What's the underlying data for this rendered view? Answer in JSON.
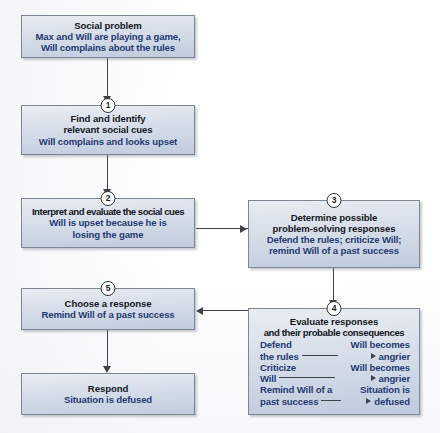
{
  "diagram": {
    "type": "flowchart",
    "nodes": [
      {
        "id": "social-problem",
        "badge": "",
        "title": "Social problem",
        "lines": [
          "Max and Will are playing a game,",
          "Will complains about the rules"
        ]
      },
      {
        "id": "find-identify",
        "badge": "1",
        "title_lines": [
          "Find and identify",
          "relevant social cues"
        ],
        "lines": [
          "Will complains and looks upset"
        ]
      },
      {
        "id": "interpret-evaluate",
        "badge": "2",
        "title_lines": [
          "Interpret and evaluate the social cues"
        ],
        "lines": [
          "Will is upset because he is",
          "losing the game"
        ]
      },
      {
        "id": "determine-responses",
        "badge": "3",
        "title_lines": [
          "Determine possible",
          "problem-solving responses"
        ],
        "lines": [
          "Defend the rules; criticize Will;",
          "remind Will of a past success"
        ]
      },
      {
        "id": "evaluate-responses",
        "badge": "4",
        "title_lines": [
          "Evaluate responses",
          "and their probable consequences"
        ],
        "consequences": [
          {
            "cause": [
              "Defend",
              "the rules"
            ],
            "effect": [
              "Will becomes",
              "angrier"
            ]
          },
          {
            "cause": [
              "Criticize",
              "Will"
            ],
            "effect": [
              "Will becomes",
              "angrier"
            ]
          },
          {
            "cause": [
              "Remind Will of a",
              "past success"
            ],
            "effect": [
              "Situation is",
              "defused"
            ]
          }
        ]
      },
      {
        "id": "choose-response",
        "badge": "5",
        "title_lines": [
          "Choose a response"
        ],
        "lines": [
          "Remind Will of a past success"
        ]
      },
      {
        "id": "respond",
        "badge": "",
        "title_lines": [
          "Respond"
        ],
        "lines": [
          "Situation is defused"
        ]
      }
    ],
    "colors": {
      "box_fill_top": "#e9edf3",
      "box_fill_bottom": "#bfcadd",
      "box_border": "#7c8694",
      "heading_text": "#14181d",
      "body_text": "#283a72",
      "connector": "#3e4349",
      "badge_fill": "#ffffff"
    }
  }
}
